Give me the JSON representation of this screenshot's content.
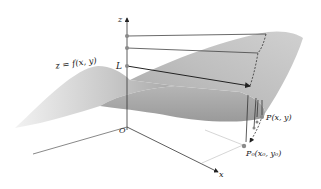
{
  "diagram": {
    "type": "3d-surface-limit-illustration",
    "labels": {
      "z_axis": "z",
      "x_axis": "x",
      "origin": "O",
      "surface": "z = f(x, y)",
      "limit": "L",
      "point": "P(x, y)",
      "base_point": "P₀(x₀, y₀)"
    },
    "colors": {
      "surface_light": "#d9d9d9",
      "surface_mid": "#bdbdbd",
      "surface_dark": "#9e9e9e",
      "axis": "#333333",
      "guide_lines": "#444444",
      "points": "#8a8a8a"
    }
  }
}
